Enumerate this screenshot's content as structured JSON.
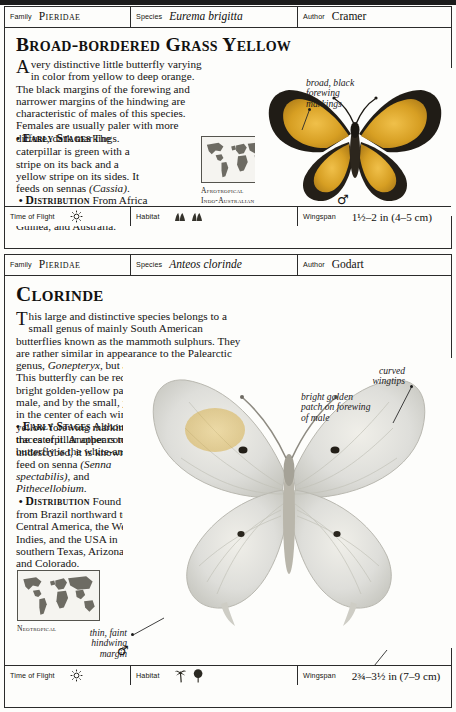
{
  "page": {
    "entries": [
      {
        "header": {
          "family_label": "Family",
          "family_value": "Pieridae",
          "species_label": "Species",
          "species_value": "Eurema brigitta",
          "author_label": "Author",
          "author_value": "Cramer"
        },
        "title": "Broad-bordered Grass Yellow",
        "text_main_dropcap": "A",
        "text_main": " very distinctive little butterfly varying in color from yellow to deep orange. The black margins of the forewing and narrower margins of the hindwing are characteristic of males of this species. Females are usually paler with more diffuse, dark markings.",
        "early_stages_heading": "Early Stages",
        "early_stages_text_1": " The caterpillar is green with a stripe on its back and a yellow stripe on its sides. It feeds on sennas ",
        "early_stages_italic": "(Cassia)",
        "early_stages_text_2": ".",
        "distribution_heading": "Distribution",
        "distribution_text": " From Africa to India, China, Papua New Guinea, and Australia.",
        "map_caption": "Afrotropical\nIndo-Australian",
        "sex_symbol": "♂",
        "annotations": [
          {
            "text": "broad, black\nforewing\nmarkings"
          }
        ],
        "footer": {
          "time_label": "Time of Flight",
          "time_icon": "sun-icon",
          "habitat_label": "Habitat",
          "habitat_icons": [
            "grassland-icon",
            "grassland-icon"
          ],
          "wingspan_label": "Wingspan",
          "wingspan_value": "1½–2 in (4–5 cm)"
        }
      },
      {
        "header": {
          "family_label": "Family",
          "family_value": "Pieridae",
          "species_label": "Species",
          "species_value": "Anteos clorinde",
          "author_label": "Author",
          "author_value": "Godart"
        },
        "title": "Clorinde",
        "text_main_dropcap": "T",
        "text_main_1": "his large and distinctive species belongs to a small genus of mainly South American butterflies known as the mammoth sulphurs. They are rather similar in appearance to the Palearctic genus, ",
        "text_main_italic": "Gonepteryx",
        "text_main_2": ", but are not closely related. This butterfly can be recognized by the large, bright golden-yellow patch on the forewing of the male, and by the small, yellow-ringed black spots in the center of each wing. Females lack the yellow forewing marking, or merely show slight traces of it. Another common name for the butterfly is the white-angled sulphur.",
        "early_stages_heading": "Early Stages",
        "early_stages_text_1": " Although the caterpillar appears to be undescribed, it is known to feed on senna ",
        "early_stages_italic_1": "(Senna spectabilis)",
        "early_stages_text_2": ", and ",
        "early_stages_italic_2": "Pithecellobium",
        "early_stages_text_3": ".",
        "distribution_heading": "Distribution",
        "distribution_text": " Found from Brazil northward to Central America, the West Indies, and the USA in southern Texas, Arizona, and Colorado.",
        "map_caption": "Neotropical",
        "sex_symbol": "♂",
        "annotations": [
          {
            "text": "curved\nwingtips"
          },
          {
            "text": "bright golden\npatch on forewing\nof male"
          },
          {
            "text": "thin, faint\nhindwing\nmargin"
          },
          {
            "text": "small, pointed tails"
          }
        ],
        "footer": {
          "time_label": "Time of Flight",
          "time_icon": "sun-icon",
          "habitat_label": "Habitat",
          "habitat_icons": [
            "palm-tree-icon",
            "broadleaf-tree-icon"
          ],
          "wingspan_label": "Wingspan",
          "wingspan_value": "2¾–3½ in (7–9 cm)"
        }
      }
    ]
  },
  "colors": {
    "rule": "#2b2b2b",
    "paper": "#fdfdfb",
    "ink": "#141312",
    "map_land": "#6d6b63",
    "butterfly_yellow": "#d9a227",
    "butterfly_black": "#1d1a15",
    "butterfly_white": "#dcdcd4"
  }
}
